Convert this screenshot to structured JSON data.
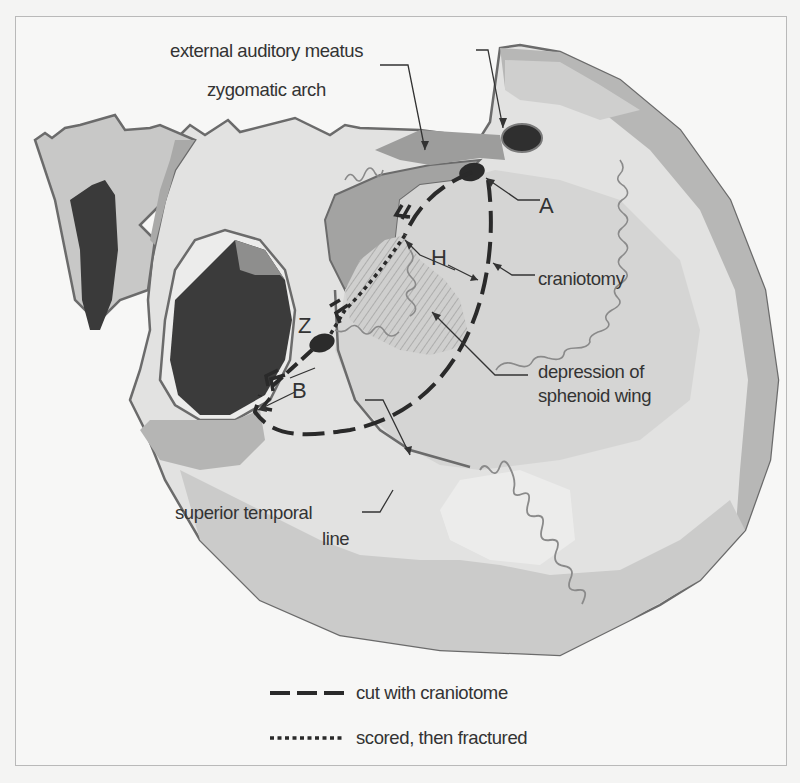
{
  "figure": {
    "labels": {
      "external_auditory_meatus": "external auditory meatus",
      "zygomatic_arch": "zygomatic arch",
      "craniotomy": "craniotomy",
      "depression_line1": "depression of",
      "depression_line2": "sphenoid wing",
      "superior_temporal_line1": "superior temporal",
      "superior_temporal_line2": "line",
      "point_a": "A",
      "point_h": "H",
      "point_z": "Z",
      "point_b": "B"
    },
    "legend": {
      "items": [
        {
          "style": "dashed",
          "label": "cut with craniotome"
        },
        {
          "style": "dotted",
          "label": "scored, then fractured"
        }
      ]
    },
    "colors": {
      "outline": "#6b6b6b",
      "bone_light": "#e3e3e2",
      "bone_mid": "#c9c9c8",
      "bone_dark": "#9e9e9e",
      "orbit_dark": "#3a3a3a",
      "cut_line": "#2a2a2a",
      "suture": "#8a8a8a",
      "text": "#333333"
    }
  }
}
